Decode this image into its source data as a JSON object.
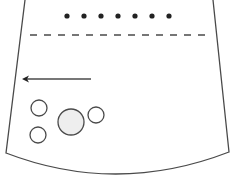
{
  "diagram": {
    "type": "device-panel-illustration",
    "colors": {
      "stroke": "#4a4a4a",
      "dot_fill": "#222222",
      "large_button_fill": "#eeeeee",
      "background": "#ffffff"
    },
    "outline": {
      "top_left": [
        25,
        0
      ],
      "bottom_left": [
        6,
        153
      ],
      "top_right": [
        213,
        0
      ],
      "bottom_right": [
        229,
        152
      ],
      "bottom_curve_low_point": [
        117,
        174
      ]
    },
    "indicator_dots": {
      "count": 7,
      "y": 16,
      "x_positions": [
        67,
        84,
        101,
        118,
        135,
        152,
        169
      ],
      "radius": 2.6
    },
    "dashed_line": {
      "x1": 30,
      "x2": 206,
      "y": 35
    },
    "arrow": {
      "direction": "left",
      "x_tail": 91,
      "x_head": 22,
      "y": 79
    },
    "buttons": [
      {
        "name": "small-button-top-left",
        "cx": 39,
        "cy": 108,
        "r": 8
      },
      {
        "name": "small-button-bottom-left",
        "cx": 38,
        "cy": 135,
        "r": 8
      },
      {
        "name": "large-center-button",
        "cx": 71,
        "cy": 122,
        "r": 13
      },
      {
        "name": "small-button-right",
        "cx": 96,
        "cy": 115,
        "r": 8
      }
    ]
  }
}
